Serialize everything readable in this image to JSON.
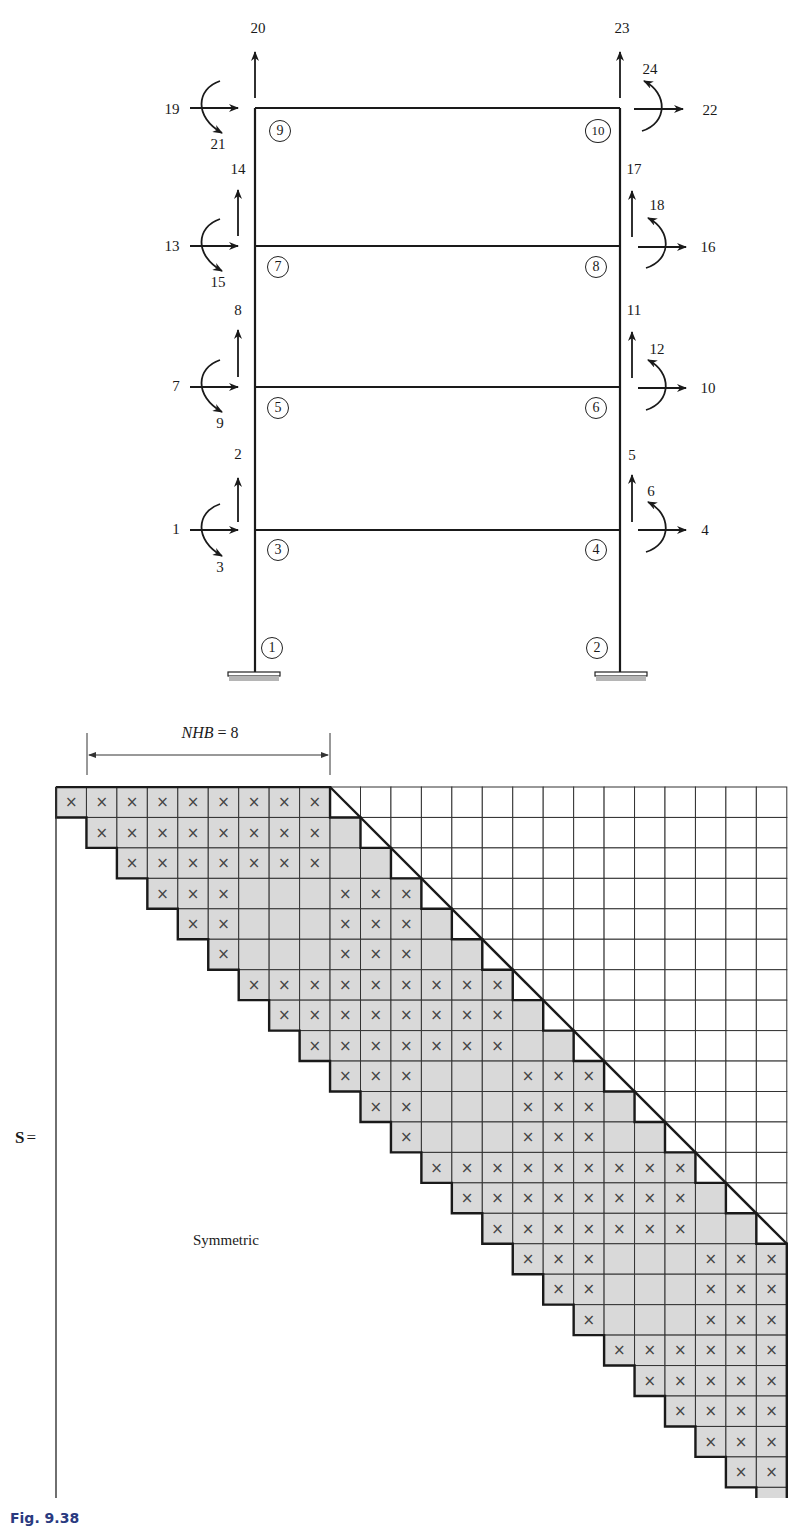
{
  "frame": {
    "nodes": [
      {
        "id": "1",
        "x": 272,
        "y": 648
      },
      {
        "id": "2",
        "x": 597,
        "y": 648
      },
      {
        "id": "3",
        "x": 278,
        "y": 550
      },
      {
        "id": "4",
        "x": 596,
        "y": 550
      },
      {
        "id": "5",
        "x": 278,
        "y": 408
      },
      {
        "id": "6",
        "x": 596,
        "y": 408
      },
      {
        "id": "7",
        "x": 278,
        "y": 267
      },
      {
        "id": "8",
        "x": 596,
        "y": 267
      },
      {
        "id": "9",
        "x": 280,
        "y": 131
      },
      {
        "id": "10",
        "x": 598,
        "y": 131
      }
    ],
    "dof_labels": [
      {
        "text": "1",
        "x": 176,
        "y": 529
      },
      {
        "text": "2",
        "x": 238,
        "y": 454
      },
      {
        "text": "3",
        "x": 220,
        "y": 567
      },
      {
        "text": "4",
        "x": 705,
        "y": 530
      },
      {
        "text": "5",
        "x": 632,
        "y": 455
      },
      {
        "text": "6",
        "x": 651,
        "y": 491
      },
      {
        "text": "7",
        "x": 176,
        "y": 386
      },
      {
        "text": "8",
        "x": 238,
        "y": 310
      },
      {
        "text": "9",
        "x": 220,
        "y": 423
      },
      {
        "text": "10",
        "x": 708,
        "y": 388
      },
      {
        "text": "11",
        "x": 634,
        "y": 310
      },
      {
        "text": "12",
        "x": 657,
        "y": 349
      },
      {
        "text": "13",
        "x": 172,
        "y": 246
      },
      {
        "text": "14",
        "x": 238,
        "y": 169
      },
      {
        "text": "15",
        "x": 218,
        "y": 282
      },
      {
        "text": "16",
        "x": 708,
        "y": 247
      },
      {
        "text": "17",
        "x": 634,
        "y": 169
      },
      {
        "text": "18",
        "x": 657,
        "y": 205
      },
      {
        "text": "19",
        "x": 172,
        "y": 109
      },
      {
        "text": "20",
        "x": 258,
        "y": 28
      },
      {
        "text": "21",
        "x": 218,
        "y": 144
      },
      {
        "text": "22",
        "x": 710,
        "y": 110
      },
      {
        "text": "23",
        "x": 622,
        "y": 28
      },
      {
        "text": "24",
        "x": 650,
        "y": 69
      }
    ]
  },
  "matrix": {
    "size": 24,
    "half_bandwidth_label": "NHB",
    "half_bandwidth_eq": "=",
    "half_bandwidth_value": "8",
    "name": "S",
    "equals": "=",
    "lower_label": "Symmetric",
    "colors": {
      "band_fill": "#d9d9d9",
      "grid": "#333333",
      "mark": "#444444"
    },
    "nonzero_rows": [
      [
        1,
        2,
        3,
        4,
        5,
        6,
        7,
        8,
        9
      ],
      [
        2,
        3,
        4,
        5,
        6,
        7,
        8,
        9
      ],
      [
        3,
        4,
        5,
        6,
        7,
        8,
        9
      ],
      [
        4,
        5,
        6,
        10,
        11,
        12
      ],
      [
        5,
        6,
        10,
        11,
        12
      ],
      [
        6,
        10,
        11,
        12
      ],
      [
        7,
        8,
        9,
        10,
        11,
        12,
        13,
        14,
        15
      ],
      [
        8,
        9,
        10,
        11,
        12,
        13,
        14,
        15
      ],
      [
        9,
        10,
        11,
        12,
        13,
        14,
        15
      ],
      [
        10,
        11,
        12,
        16,
        17,
        18
      ],
      [
        11,
        12,
        16,
        17,
        18
      ],
      [
        12,
        16,
        17,
        18
      ],
      [
        13,
        14,
        15,
        16,
        17,
        18,
        19,
        20,
        21
      ],
      [
        14,
        15,
        16,
        17,
        18,
        19,
        20,
        21
      ],
      [
        15,
        16,
        17,
        18,
        19,
        20,
        21
      ],
      [
        16,
        17,
        18,
        22,
        23,
        24
      ],
      [
        17,
        18,
        22,
        23,
        24
      ],
      [
        18,
        22,
        23,
        24
      ],
      [
        19,
        20,
        21,
        22,
        23,
        24
      ],
      [
        20,
        21,
        22,
        23,
        24
      ],
      [
        21,
        22,
        23,
        24
      ],
      [
        22,
        23,
        24
      ],
      [
        23,
        24
      ],
      [
        24
      ]
    ],
    "mark_glyph": "×"
  },
  "caption": {
    "text": "Fig. 9.38"
  }
}
